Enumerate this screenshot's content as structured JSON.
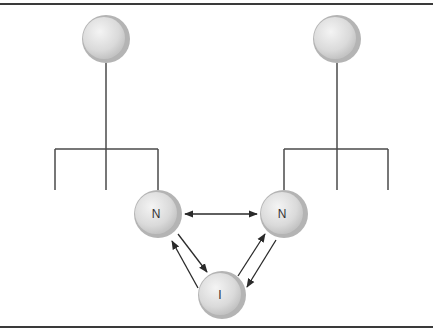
{
  "diagram": {
    "colors": {
      "line": "#4a4a4a",
      "border": "#3a3a3a",
      "node_fill_light": "#eeeeee",
      "node_fill_dark": "#c8c8c8",
      "node_rim": "#a8a8a8",
      "label": "#333333"
    },
    "nodes": [
      {
        "id": "root-left",
        "label": "",
        "cx": 106,
        "cy": 39,
        "r": 24
      },
      {
        "id": "root-right",
        "label": "",
        "cx": 337,
        "cy": 39,
        "r": 24
      },
      {
        "id": "n-left",
        "label": "N",
        "cx": 158,
        "cy": 214,
        "r": 24
      },
      {
        "id": "n-right",
        "label": "N",
        "cx": 284,
        "cy": 214,
        "r": 24
      },
      {
        "id": "i-node",
        "label": "I",
        "cx": 222,
        "cy": 295,
        "r": 24
      }
    ],
    "labels": {
      "n_left": "N",
      "n_right": "N",
      "i_node": "I"
    },
    "edges": [
      {
        "from": "n-left",
        "to": "n-right",
        "type": "bidirectional"
      },
      {
        "from": "n-left",
        "to": "i-node",
        "type": "directed"
      },
      {
        "from": "i-node",
        "to": "n-left",
        "type": "directed"
      },
      {
        "from": "n-right",
        "to": "i-node",
        "type": "directed"
      },
      {
        "from": "i-node",
        "to": "n-right",
        "type": "directed"
      }
    ],
    "trees": [
      {
        "root": "root-left",
        "bar_y": 149,
        "bar_x1": 55,
        "bar_x2": 158,
        "branches_x": [
          55,
          106,
          158
        ],
        "branch_end_y": 190
      },
      {
        "root": "root-right",
        "bar_y": 149,
        "bar_x1": 284,
        "bar_x2": 388,
        "branches_x": [
          284,
          337,
          388
        ],
        "branch_end_y": 190
      }
    ]
  }
}
